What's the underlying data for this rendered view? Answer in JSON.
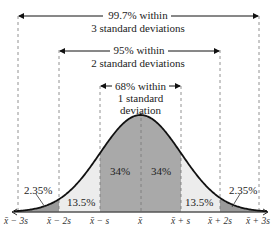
{
  "figure": {
    "brackets": [
      {
        "line1": "99.7% within",
        "line2": "3 standard deviations"
      },
      {
        "line1": "95% within",
        "line2": "2 standard deviations"
      },
      {
        "line1": "68% within",
        "line2": "1 standard",
        "line3": "deviation"
      }
    ],
    "regions": {
      "left_tail": "2.35%",
      "left_two": "13.5%",
      "left_one": "34%",
      "right_one": "34%",
      "right_two": "13.5%",
      "right_tail": "2.35%"
    },
    "ticks": [
      "x̄ − 3s",
      "x̄ − 2s",
      "x̄ − s",
      "x̄",
      "x̄ + s",
      "x̄ + 2s",
      "x̄ + 3s"
    ],
    "colors": {
      "dark_fill": "#a9a9a9",
      "light_fill": "#ececec",
      "tail_fill": "#9a9a9a",
      "curve": "#111111"
    }
  },
  "chart_data": {
    "type": "area",
    "xlabel": "",
    "ylabel": "",
    "categories": [
      "x̄ − 3s",
      "x̄ − 2s",
      "x̄ − s",
      "x̄",
      "x̄ + s",
      "x̄ + 2s",
      "x̄ + 3s"
    ],
    "regions": [
      {
        "from": "x̄ − 3s",
        "to": "x̄ − 2s",
        "percent": 2.35
      },
      {
        "from": "x̄ − 2s",
        "to": "x̄ − s",
        "percent": 13.5
      },
      {
        "from": "x̄ − s",
        "to": "x̄",
        "percent": 34
      },
      {
        "from": "x̄",
        "to": "x̄ + s",
        "percent": 34
      },
      {
        "from": "x̄ + s",
        "to": "x̄ + 2s",
        "percent": 13.5
      },
      {
        "from": "x̄ + 2s",
        "to": "x̄ + 3s",
        "percent": 2.35
      }
    ],
    "intervals": [
      {
        "label": "68% within 1 standard deviation",
        "range": [
          "x̄ − s",
          "x̄ + s"
        ],
        "percent": 68
      },
      {
        "label": "95% within 2 standard deviations",
        "range": [
          "x̄ − 2s",
          "x̄ + 2s"
        ],
        "percent": 95
      },
      {
        "label": "99.7% within 3 standard deviations",
        "range": [
          "x̄ − 3s",
          "x̄ + 3s"
        ],
        "percent": 99.7
      }
    ],
    "grid": false
  }
}
